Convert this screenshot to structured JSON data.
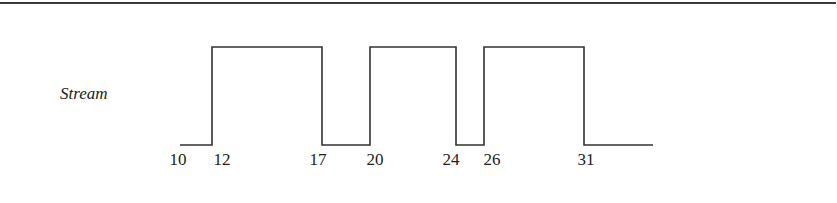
{
  "diagram": {
    "signal_label": "Stream",
    "line_color": "#333333",
    "transitions": [
      {
        "t": 10,
        "level": "low"
      },
      {
        "t": 12,
        "level": "high"
      },
      {
        "t": 17,
        "level": "low"
      },
      {
        "t": 20,
        "level": "high"
      },
      {
        "t": 24,
        "level": "low"
      },
      {
        "t": 26,
        "level": "high"
      },
      {
        "t": 31,
        "level": "low"
      }
    ],
    "tick_labels": [
      "10",
      "12",
      "17",
      "20",
      "24",
      "26",
      "31"
    ]
  }
}
